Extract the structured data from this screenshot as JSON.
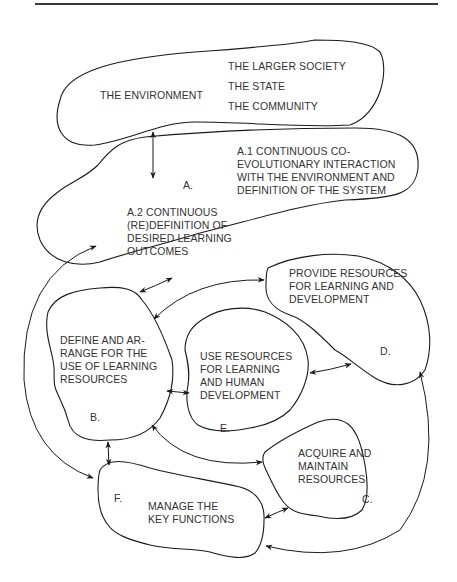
{
  "diagram": {
    "environment": {
      "label": "THE ENVIRONMENT",
      "items": [
        "THE LARGER SOCIETY",
        "THE STATE",
        "THE COMMUNITY"
      ]
    },
    "nodes": {
      "A": {
        "letter": "A.",
        "a1": [
          "A.1 CONTINUOUS CO-",
          "EVOLUTIONARY INTERACTION",
          "WITH THE ENVIRONMENT AND",
          "DEFINITION OF THE SYSTEM"
        ],
        "a2": [
          "A.2 CONTINUOUS",
          "(RE)DEFINITION OF",
          "DESIRED LEARNING",
          "OUTCOMES"
        ]
      },
      "B": {
        "letter": "B.",
        "lines": [
          "DEFINE AND AR-",
          "RANGE FOR THE",
          "USE OF LEARNING",
          "RESOURCES"
        ]
      },
      "C": {
        "letter": "C.",
        "lines": [
          "ACQUIRE AND",
          "MAINTAIN",
          "RESOURCES"
        ]
      },
      "D": {
        "letter": "D.",
        "lines": [
          "PROVIDE RESOURCES",
          "FOR LEARNING AND",
          "DEVELOPMENT"
        ]
      },
      "E": {
        "letter": "E.",
        "lines": [
          "USE RESOURCES",
          "FOR LEARNING",
          "AND HUMAN",
          "DEVELOPMENT"
        ]
      },
      "F": {
        "letter": "F.",
        "lines": [
          "MANAGE THE",
          "KEY FUNCTIONS"
        ]
      }
    },
    "connections": [
      {
        "from": "Environment",
        "to": "A",
        "type": "bidirectional"
      },
      {
        "from": "A",
        "to": "B",
        "type": "bidirectional"
      },
      {
        "from": "B",
        "to": "D",
        "type": "bidirectional"
      },
      {
        "from": "B",
        "to": "E",
        "type": "bidirectional"
      },
      {
        "from": "E",
        "to": "D",
        "type": "bidirectional"
      },
      {
        "from": "B",
        "to": "F",
        "type": "bidirectional"
      },
      {
        "from": "A",
        "to": "F",
        "type": "bidirectional"
      },
      {
        "from": "B",
        "to": "C",
        "type": "bidirectional"
      },
      {
        "from": "F",
        "to": "C",
        "type": "bidirectional"
      },
      {
        "from": "F",
        "to": "D",
        "type": "bidirectional"
      }
    ]
  }
}
